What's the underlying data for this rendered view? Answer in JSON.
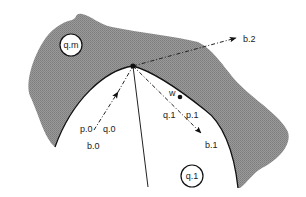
{
  "diagram": {
    "colors": {
      "region_fill": "#8f8f8f",
      "stroke": "#111111",
      "background": "#ffffff"
    },
    "regions": [
      {
        "id": "q.m",
        "label": "q.m",
        "shaded": true
      },
      {
        "id": "q.1",
        "label": "q.1",
        "shaded": false
      }
    ],
    "vertex": {
      "x": 133,
      "y": 66
    },
    "point_w": {
      "label": "w",
      "x": 180,
      "y": 97
    },
    "arrows": [
      {
        "id": "b.0",
        "label": "b.0",
        "side_labels": [
          "p.0",
          "q.0"
        ]
      },
      {
        "id": "b.1",
        "label": "b.1",
        "side_labels": [
          "q.1",
          "p.1"
        ]
      },
      {
        "id": "b.2",
        "label": "b.2"
      }
    ],
    "labels": {
      "qm": "q.m",
      "q1_region": "q.1",
      "w": "w",
      "p0": "p.0",
      "q0": "q.0",
      "b0": "b.0",
      "q1": "q.1",
      "p1": "p.1",
      "b1": "b.1",
      "b2": "b.2"
    }
  }
}
